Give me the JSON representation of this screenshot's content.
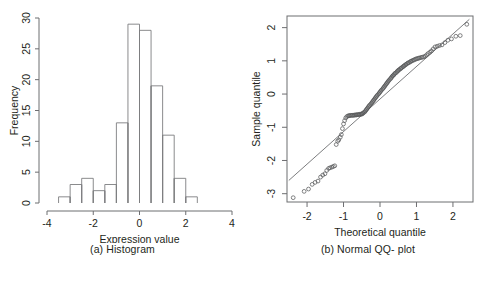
{
  "figure": {
    "background": "#ffffff",
    "ink": "#231f20",
    "axis_color": "#6d6e71",
    "panels": [
      "histogram",
      "qqplot"
    ]
  },
  "panel_a": {
    "caption": "(a) Histogram",
    "chart_data": {
      "type": "bar",
      "title": "",
      "xlabel": "Expression value",
      "ylabel": "Frequency",
      "xlim": [
        -4,
        4
      ],
      "ylim": [
        0,
        30
      ],
      "xticks": [
        -4,
        -2,
        0,
        2,
        4
      ],
      "xtick_labels": [
        "-4",
        "-2",
        "0",
        "2",
        "4"
      ],
      "yticks": [
        0,
        5,
        10,
        15,
        20,
        25,
        30
      ],
      "ytick_labels": [
        "0",
        "5",
        "10",
        "15",
        "20",
        "25",
        "30"
      ],
      "grid": false,
      "legend": false,
      "bin_width": 0.5,
      "bin_edges": [
        -3.5,
        -3.0,
        -2.5,
        -2.0,
        -1.5,
        -1.0,
        -0.5,
        0.0,
        0.5,
        1.0,
        1.5,
        2.0,
        2.5
      ],
      "categories": [
        "-3.5..-3.0",
        "-3.0..-2.5",
        "-2.5..-2.0",
        "-2.0..-1.5",
        "-1.5..-1.0",
        "-1.0..-0.5",
        "-0.5..0.0",
        "0.0..0.5",
        "0.5..1.0",
        "1.0..1.5",
        "1.5..2.0",
        "2.0..2.5"
      ],
      "values": [
        1,
        3,
        4,
        2,
        3,
        13,
        29,
        28,
        19,
        11,
        4,
        1
      ]
    }
  },
  "panel_b": {
    "caption": "(b) Normal QQ- plot",
    "chart_data": {
      "type": "scatter",
      "title": "",
      "xlabel": "Theoretical quantile",
      "ylabel": "Sample quantile",
      "xlim": [
        -2.55,
        2.55
      ],
      "ylim": [
        -3.25,
        2.35
      ],
      "xticks": [
        -2,
        -1,
        0,
        1,
        2
      ],
      "xtick_labels": [
        "-2",
        "-1",
        "0",
        "1",
        "2"
      ],
      "yticks": [
        -3,
        -2,
        -1,
        0,
        1,
        2
      ],
      "ytick_labels": [
        "-3",
        "-2",
        "-1",
        "0",
        "1",
        "2"
      ],
      "grid": false,
      "legend": false,
      "marker": "open-circle",
      "reference_line": {
        "label": "qq-reference-line",
        "x": [
          -2.5,
          2.45
        ],
        "y": [
          -2.6,
          2.25
        ]
      },
      "points": [
        [
          -2.38,
          -3.12
        ],
        [
          -2.08,
          -2.93
        ],
        [
          -1.96,
          -2.86
        ],
        [
          -1.86,
          -2.72
        ],
        [
          -1.78,
          -2.66
        ],
        [
          -1.7,
          -2.62
        ],
        [
          -1.63,
          -2.5
        ],
        [
          -1.57,
          -2.44
        ],
        [
          -1.51,
          -2.4
        ],
        [
          -1.46,
          -2.3
        ],
        [
          -1.41,
          -2.24
        ],
        [
          -1.37,
          -2.22
        ],
        [
          -1.32,
          -2.2
        ],
        [
          -1.28,
          -2.18
        ],
        [
          -1.24,
          -2.16
        ],
        [
          -1.2,
          -1.52
        ],
        [
          -1.16,
          -1.42
        ],
        [
          -1.13,
          -1.38
        ],
        [
          -1.09,
          -1.3
        ],
        [
          -1.06,
          -1.22
        ],
        [
          -1.03,
          -1.04
        ],
        [
          -1.0,
          -0.9
        ],
        [
          -0.97,
          -0.8
        ],
        [
          -0.94,
          -0.72
        ],
        [
          -0.91,
          -0.68
        ],
        [
          -0.88,
          -0.66
        ],
        [
          -0.85,
          -0.65
        ],
        [
          -0.83,
          -0.65
        ],
        [
          -0.8,
          -0.64
        ],
        [
          -0.77,
          -0.64
        ],
        [
          -0.75,
          -0.64
        ],
        [
          -0.72,
          -0.64
        ],
        [
          -0.7,
          -0.63
        ],
        [
          -0.67,
          -0.63
        ],
        [
          -0.65,
          -0.63
        ],
        [
          -0.63,
          -0.62
        ],
        [
          -0.6,
          -0.62
        ],
        [
          -0.58,
          -0.62
        ],
        [
          -0.56,
          -0.61
        ],
        [
          -0.53,
          -0.61
        ],
        [
          -0.51,
          -0.6
        ],
        [
          -0.49,
          -0.6
        ],
        [
          -0.47,
          -0.58
        ],
        [
          -0.45,
          -0.56
        ],
        [
          -0.42,
          -0.54
        ],
        [
          -0.4,
          -0.51
        ],
        [
          -0.38,
          -0.48
        ],
        [
          -0.36,
          -0.45
        ],
        [
          -0.34,
          -0.42
        ],
        [
          -0.32,
          -0.39
        ],
        [
          -0.3,
          -0.36
        ],
        [
          -0.28,
          -0.33
        ],
        [
          -0.25,
          -0.3
        ],
        [
          -0.23,
          -0.27
        ],
        [
          -0.21,
          -0.24
        ],
        [
          -0.19,
          -0.21
        ],
        [
          -0.17,
          -0.18
        ],
        [
          -0.15,
          -0.15
        ],
        [
          -0.13,
          -0.12
        ],
        [
          -0.11,
          -0.09
        ],
        [
          -0.09,
          -0.06
        ],
        [
          -0.07,
          -0.03
        ],
        [
          -0.04,
          0.0
        ],
        [
          -0.02,
          0.03
        ],
        [
          0.0,
          0.06
        ],
        [
          0.02,
          0.09
        ],
        [
          0.04,
          0.12
        ],
        [
          0.07,
          0.15
        ],
        [
          0.09,
          0.18
        ],
        [
          0.11,
          0.21
        ],
        [
          0.13,
          0.24
        ],
        [
          0.15,
          0.27
        ],
        [
          0.17,
          0.3
        ],
        [
          0.19,
          0.33
        ],
        [
          0.21,
          0.36
        ],
        [
          0.23,
          0.39
        ],
        [
          0.25,
          0.42
        ],
        [
          0.28,
          0.45
        ],
        [
          0.3,
          0.48
        ],
        [
          0.32,
          0.51
        ],
        [
          0.34,
          0.54
        ],
        [
          0.36,
          0.56
        ],
        [
          0.38,
          0.58
        ],
        [
          0.4,
          0.61
        ],
        [
          0.42,
          0.63
        ],
        [
          0.45,
          0.65
        ],
        [
          0.47,
          0.68
        ],
        [
          0.49,
          0.7
        ],
        [
          0.51,
          0.72
        ],
        [
          0.53,
          0.74
        ],
        [
          0.56,
          0.76
        ],
        [
          0.58,
          0.78
        ],
        [
          0.6,
          0.8
        ],
        [
          0.63,
          0.82
        ],
        [
          0.65,
          0.84
        ],
        [
          0.67,
          0.86
        ],
        [
          0.7,
          0.88
        ],
        [
          0.72,
          0.9
        ],
        [
          0.75,
          0.92
        ],
        [
          0.77,
          0.94
        ],
        [
          0.8,
          0.95
        ],
        [
          0.83,
          0.97
        ],
        [
          0.85,
          0.99
        ],
        [
          0.88,
          1.0
        ],
        [
          0.91,
          1.02
        ],
        [
          0.94,
          1.03
        ],
        [
          0.97,
          1.05
        ],
        [
          1.0,
          1.06
        ],
        [
          1.03,
          1.07
        ],
        [
          1.06,
          1.08
        ],
        [
          1.09,
          1.09
        ],
        [
          1.13,
          1.1
        ],
        [
          1.16,
          1.11
        ],
        [
          1.2,
          1.12
        ],
        [
          1.24,
          1.14
        ],
        [
          1.28,
          1.18
        ],
        [
          1.32,
          1.22
        ],
        [
          1.37,
          1.26
        ],
        [
          1.41,
          1.3
        ],
        [
          1.46,
          1.36
        ],
        [
          1.51,
          1.42
        ],
        [
          1.57,
          1.44
        ],
        [
          1.63,
          1.46
        ],
        [
          1.7,
          1.48
        ],
        [
          1.78,
          1.55
        ],
        [
          1.86,
          1.62
        ],
        [
          1.96,
          1.66
        ],
        [
          2.08,
          1.74
        ],
        [
          2.2,
          1.76
        ],
        [
          2.38,
          2.1
        ]
      ]
    }
  }
}
